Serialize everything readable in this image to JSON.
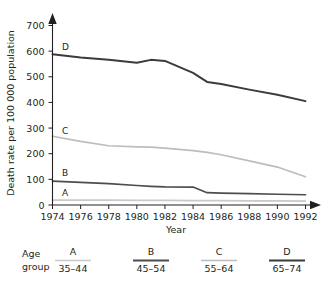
{
  "chart_data": {
    "type": "line",
    "title": "",
    "xlabel": "Year",
    "ylabel": "Death rate per 100 000 population",
    "xlim": [
      1974,
      1992
    ],
    "ylim": [
      0,
      700
    ],
    "grid": false,
    "legend_position": "below",
    "x_ticks": [
      1974,
      1976,
      1978,
      1980,
      1982,
      1984,
      1986,
      1988,
      1990,
      1992
    ],
    "y_ticks": [
      0,
      100,
      200,
      300,
      400,
      500,
      600,
      700
    ],
    "x": [
      1974,
      1976,
      1978,
      1980,
      1981,
      1982,
      1984,
      1985,
      1986,
      1988,
      1990,
      1992
    ],
    "series": [
      {
        "name": "A",
        "label": "A",
        "age_group": "35–44",
        "color": "#c9c9c9",
        "values": [
          19,
          19,
          19,
          18,
          18,
          18,
          17,
          17,
          17,
          16,
          16,
          15
        ]
      },
      {
        "name": "B",
        "label": "B",
        "age_group": "45–54",
        "color": "#4d4d4d",
        "values": [
          93,
          88,
          83,
          76,
          73,
          71,
          70,
          48,
          46,
          44,
          42,
          40
        ]
      },
      {
        "name": "C",
        "label": "C",
        "age_group": "55–64",
        "color": "#bdbdbd",
        "values": [
          268,
          248,
          231,
          227,
          226,
          222,
          212,
          205,
          196,
          172,
          148,
          110
        ]
      },
      {
        "name": "D",
        "label": "D",
        "age_group": "65–74",
        "color": "#3b3b3b",
        "values": [
          588,
          575,
          566,
          555,
          566,
          562,
          515,
          480,
          472,
          450,
          430,
          405
        ]
      }
    ]
  },
  "legend": {
    "group_label_line1": "Age",
    "group_label_line2": "group",
    "entries": [
      {
        "key": "A",
        "range": "35–44",
        "color": "#c9c9c9"
      },
      {
        "key": "B",
        "range": "45–54",
        "color": "#4d4d4d"
      },
      {
        "key": "C",
        "range": "55–64",
        "color": "#bdbdbd"
      },
      {
        "key": "D",
        "range": "65–74",
        "color": "#3b3b3b"
      }
    ]
  },
  "axis": {
    "y_title": "Death rate per 100 000 population",
    "x_title": "Year",
    "y_tick_labels": [
      "0",
      "100",
      "200",
      "300",
      "400",
      "500",
      "600",
      "700"
    ],
    "x_tick_labels": [
      "1974",
      "1976",
      "1978",
      "1980",
      "1982",
      "1984",
      "1986",
      "1988",
      "1990",
      "1992"
    ]
  },
  "series_labels": {
    "a": "A",
    "b": "B",
    "c": "C",
    "d": "D"
  }
}
